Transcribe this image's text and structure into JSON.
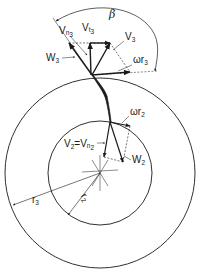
{
  "figure": {
    "type": "centrifugal impeller velocity diagram",
    "colors": {
      "ink": "#1a1a1a",
      "background": "#ffffff"
    }
  },
  "labels": {
    "beta": "β",
    "W3": {
      "main": "W",
      "sub": "3"
    },
    "Vn3": {
      "main": "V",
      "sub": "n",
      "subsub": "3"
    },
    "Vt3": {
      "main": "V",
      "sub": "t",
      "subsub": "3"
    },
    "V3": {
      "main": "V",
      "sub": "3"
    },
    "omega_r3": {
      "main": "ωr",
      "sub": "3"
    },
    "omega_r2": {
      "main": "ωr",
      "sub": "2"
    },
    "V2_eq": {
      "main": "V",
      "sub": "2",
      "eq": "=",
      "main2": "V",
      "sub2": "n",
      "subsub2": "2"
    },
    "W2": {
      "main": "W",
      "sub": "2"
    },
    "r3": {
      "main": "r",
      "sub": "3"
    },
    "r2": {
      "main": "r",
      "sub": "2"
    }
  }
}
